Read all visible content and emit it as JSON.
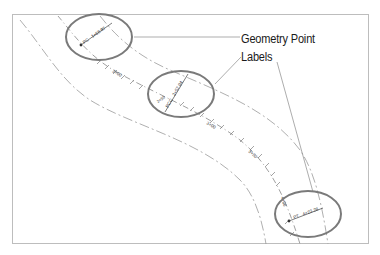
{
  "callout": {
    "line1": "Geometry Point",
    "line2": "Labels"
  },
  "geometry_points": [
    {
      "id": "pc",
      "label": "PC  1+68.97",
      "short": "PC",
      "station": "1+68.97"
    },
    {
      "id": "pcc",
      "label": "PCC  2+57.94",
      "short": "PCC",
      "station": "2+57.94"
    },
    {
      "id": "pt",
      "label": "PT  4+23.28",
      "short": "PT",
      "station": "4+23.28"
    }
  ],
  "station_labels": [
    "2+00",
    "2+50",
    "3+00",
    "3+50",
    "4+00"
  ],
  "colors": {
    "ellipse": "#7a7a7a",
    "alignment": "#555555",
    "offset": "#9a9a9a",
    "leader": "#8a8a8a",
    "frame": "#bdbdbd"
  }
}
